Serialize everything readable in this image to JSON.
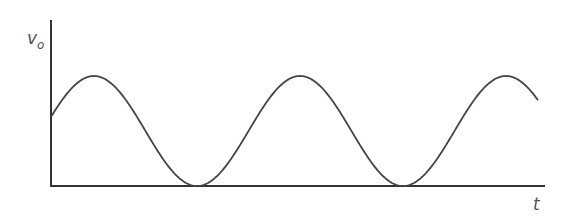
{
  "diagram": {
    "type": "waveform",
    "y_axis_label": "v",
    "y_axis_subscript": "o",
    "x_axis_label": "t",
    "colors": {
      "axis": "#333333",
      "curve": "#444444",
      "label": "#555555",
      "background": "#ffffff"
    },
    "geometry": {
      "origin_x": 51,
      "origin_y": 186,
      "axis_top_y": 20,
      "axis_right_x": 545,
      "curve_start_x": 51,
      "curve_end_x": 538,
      "peak_y": 76,
      "trough_y": 186,
      "first_peak_x": 94,
      "period_px": 206
    },
    "features": {
      "peaks_visible": 3,
      "troughs_touching_axis": 2
    }
  }
}
